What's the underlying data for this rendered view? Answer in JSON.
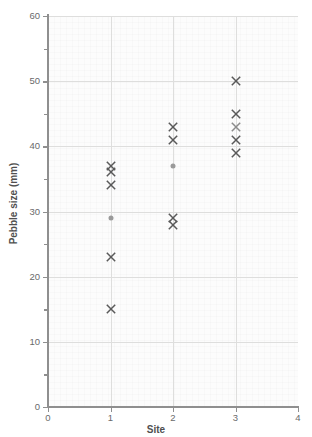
{
  "top_partial_text": "",
  "axes": {
    "x": {
      "title": "Site",
      "min": 0,
      "max": 4,
      "ticks": [
        0,
        1,
        2,
        3,
        4
      ],
      "tick_labels": [
        "0",
        "1",
        "2",
        "3",
        "4"
      ]
    },
    "y": {
      "title": "Pebble size (mm)",
      "min": 0,
      "max": 60,
      "ticks": [
        0,
        10,
        20,
        30,
        40,
        50,
        60
      ],
      "tick_labels": [
        "0",
        "10",
        "20",
        "30",
        "40",
        "50",
        "60"
      ],
      "minor_ticks": [
        5,
        15,
        25,
        35,
        45,
        55
      ]
    }
  },
  "colors": {
    "marker_cross": "#595959",
    "marker_dot": "#9a9a9a",
    "marker_cross_light": "#8c8c8c",
    "gridline": "#dededd",
    "axis": "#8f8f8f",
    "axis_text": "#6a6a6a",
    "axis_title": "#4f4f4f",
    "plot_background": "#fcfcfc"
  },
  "chart_data": {
    "type": "scatter",
    "title": "",
    "xlabel": "Site",
    "ylabel": "Pebble size (mm)",
    "xlim": [
      0,
      4
    ],
    "ylim": [
      0,
      60
    ],
    "grid": true,
    "legend": "none",
    "series": [
      {
        "name": "Pebble measurements",
        "marker": "cross",
        "points": [
          {
            "x": 1,
            "y": 37,
            "marker": "cross"
          },
          {
            "x": 1,
            "y": 36,
            "marker": "cross"
          },
          {
            "x": 1,
            "y": 34,
            "marker": "cross"
          },
          {
            "x": 1,
            "y": 29,
            "marker": "dot"
          },
          {
            "x": 1,
            "y": 23,
            "marker": "cross"
          },
          {
            "x": 1,
            "y": 15,
            "marker": "cross"
          },
          {
            "x": 2,
            "y": 43,
            "marker": "cross"
          },
          {
            "x": 2,
            "y": 41,
            "marker": "cross"
          },
          {
            "x": 2,
            "y": 37,
            "marker": "dot"
          },
          {
            "x": 2,
            "y": 29,
            "marker": "cross"
          },
          {
            "x": 2,
            "y": 28,
            "marker": "cross"
          },
          {
            "x": 3,
            "y": 50,
            "marker": "cross"
          },
          {
            "x": 3,
            "y": 45,
            "marker": "cross"
          },
          {
            "x": 3,
            "y": 43,
            "marker": "cross-light"
          },
          {
            "x": 3,
            "y": 41,
            "marker": "cross"
          },
          {
            "x": 3,
            "y": 39,
            "marker": "cross"
          }
        ]
      }
    ],
    "site_summaries": [
      {
        "site": 1,
        "values": [
          37,
          36,
          34,
          29,
          23,
          15
        ],
        "mean_marker_value": 29
      },
      {
        "site": 2,
        "values": [
          43,
          41,
          37,
          29,
          28
        ],
        "mean_marker_value": 37
      },
      {
        "site": 3,
        "values": [
          50,
          45,
          43,
          41,
          39
        ],
        "mean_marker_value": 43
      }
    ]
  }
}
